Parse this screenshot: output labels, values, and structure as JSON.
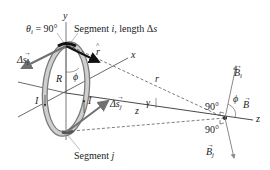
{
  "diagram": {
    "labels": {
      "theta_i": "θ",
      "theta_sub": "i",
      "theta_eq": " = 90°",
      "segment_i": "Segment ",
      "segment_i_italic": "i",
      "segment_i_rest": ", length Δ",
      "segment_i_s": "s",
      "segment_j": "Segment ",
      "segment_j_italic": "j",
      "delta_s_i": "Δs",
      "delta_s_i_sub": "i",
      "delta_s_j": "Δs",
      "delta_s_j_sub": "j",
      "r_hat": "r",
      "R": "R",
      "phi_loop": "ϕ",
      "I_left": "I",
      "I_right": "I",
      "axis_y": "y",
      "axis_x": "x",
      "axis_z_left": "z",
      "axis_z_right": "z",
      "r": "r",
      "gamma": "γ",
      "angle_90_top": "90°",
      "angle_90_bottom": "90°",
      "phi_field": "ϕ",
      "B_i": "B",
      "B_i_sub": "i",
      "B_j": "B",
      "B_j_sub": "j",
      "B": "B"
    },
    "colors": {
      "loop_outer": "#8a8a8a",
      "loop_inner": "#c8c8c8",
      "vector_dark": "#111111",
      "vector_gray": "#707070",
      "axis": "#333333",
      "field_vector": "#8a8a8a"
    }
  }
}
